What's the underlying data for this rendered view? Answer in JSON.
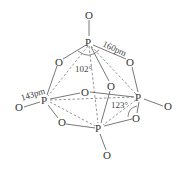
{
  "diagram": {
    "atoms": {
      "o_top": "O",
      "p_top": "P",
      "o_ul": "O",
      "o_ur": "O",
      "o_center": "O",
      "o_front": "O",
      "p_left": "P",
      "o_left": "O",
      "p_right": "P",
      "o_right": "O",
      "o_ll": "O",
      "o_lr": "O",
      "p_bottom": "P",
      "o_bottom": "O"
    },
    "labels": {
      "bond_terminal": "143pm",
      "bond_bridge": "160pm",
      "angle_opo": "102°",
      "angle_pop": "123°"
    }
  }
}
